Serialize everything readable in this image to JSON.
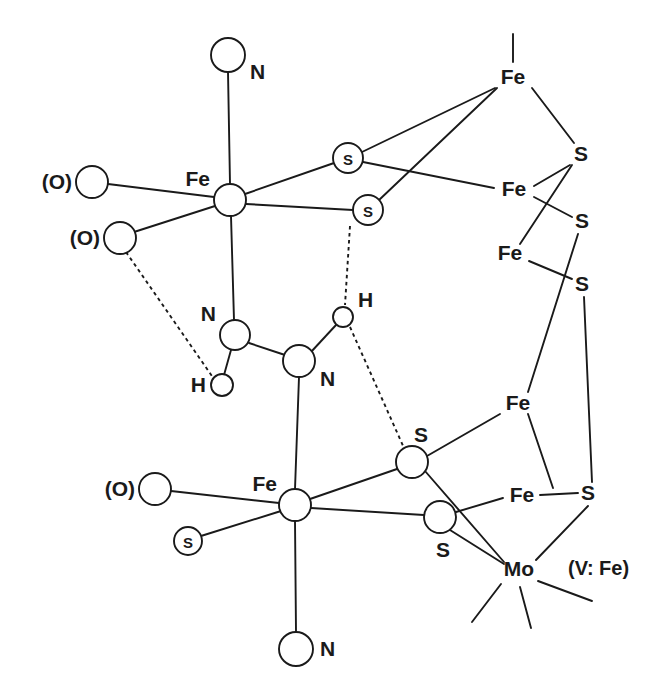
{
  "figure": {
    "kind": "chemical-structure-diagram",
    "title": "",
    "note": "(V: Fe)",
    "background_color": "#ffffff",
    "line_color": "#1a1a1a"
  },
  "labels": {
    "fe": "Fe",
    "s": "S",
    "n": "N",
    "h": "H",
    "mo": "Mo",
    "o_parenthetical": "(O)",
    "s_circled": "S",
    "alt_metal_note": "(V: Fe)"
  },
  "atoms": [
    {
      "id": "N-top",
      "label": "N",
      "label_pos": "right",
      "style": "open-circle",
      "x": 228,
      "y": 55,
      "r": 17
    },
    {
      "id": "Fe-upper",
      "label": "Fe",
      "label_pos": "upleft",
      "style": "open-circle",
      "x": 230,
      "y": 200,
      "r": 16
    },
    {
      "id": "O-upper",
      "label": "(O)",
      "label_pos": "left",
      "style": "open-circle",
      "x": 92,
      "y": 182,
      "r": 16
    },
    {
      "id": "O-lower",
      "label": "(O)",
      "label_pos": "left",
      "style": "open-circle",
      "x": 120,
      "y": 238,
      "r": 16
    },
    {
      "id": "S-bridge-1",
      "label": "S",
      "label_pos": "inside",
      "style": "circled-atom",
      "x": 348,
      "y": 158,
      "r": 15
    },
    {
      "id": "S-bridge-2",
      "label": "S",
      "label_pos": "inside",
      "style": "circled-atom",
      "x": 368,
      "y": 210,
      "r": 15
    },
    {
      "id": "Fe-top-right",
      "label": "Fe",
      "label_pos": "center",
      "style": "text-only",
      "x": 513,
      "y": 78,
      "r": 0
    },
    {
      "id": "S-tr-1",
      "label": "S",
      "label_pos": "center",
      "style": "text-only",
      "x": 581,
      "y": 155,
      "r": 0
    },
    {
      "id": "Fe-right-2",
      "label": "Fe",
      "label_pos": "center",
      "style": "text-only",
      "x": 514,
      "y": 190,
      "r": 0
    },
    {
      "id": "S-tr-2",
      "label": "S",
      "label_pos": "center",
      "style": "text-only",
      "x": 582,
      "y": 222,
      "r": 0
    },
    {
      "id": "Fe-right-3",
      "label": "Fe",
      "label_pos": "center",
      "style": "text-only",
      "x": 510,
      "y": 254,
      "r": 0
    },
    {
      "id": "S-tr-3",
      "label": "S",
      "label_pos": "center",
      "style": "text-only",
      "x": 582,
      "y": 285,
      "r": 0
    },
    {
      "id": "N-mid-left",
      "label": "N",
      "label_pos": "upleft",
      "style": "open-circle",
      "x": 235,
      "y": 335,
      "r": 15
    },
    {
      "id": "H-left",
      "label": "H",
      "label_pos": "left",
      "style": "open-circle",
      "x": 222,
      "y": 385,
      "r": 11
    },
    {
      "id": "N-mid-right",
      "label": "N",
      "label_pos": "right",
      "style": "open-circle",
      "x": 299,
      "y": 361,
      "r": 16
    },
    {
      "id": "H-right",
      "label": "H",
      "label_pos": "upright",
      "style": "open-circle",
      "x": 343,
      "y": 317,
      "r": 10
    },
    {
      "id": "S-mid",
      "label": "S",
      "label_pos": "upright",
      "style": "open-circle",
      "x": 412,
      "y": 462,
      "r": 16
    },
    {
      "id": "Fe-lower",
      "label": "Fe",
      "label_pos": "upleft",
      "style": "open-circle",
      "x": 295,
      "y": 505,
      "r": 16
    },
    {
      "id": "O-bottom",
      "label": "(O)",
      "label_pos": "left",
      "style": "open-circle",
      "x": 155,
      "y": 489,
      "r": 16
    },
    {
      "id": "S-circled-lo",
      "label": "S",
      "label_pos": "inside",
      "style": "circled-atom",
      "x": 188,
      "y": 541,
      "r": 14
    },
    {
      "id": "S-lower-br",
      "label": "S",
      "label_pos": "down",
      "style": "open-circle",
      "x": 440,
      "y": 517,
      "r": 16
    },
    {
      "id": "N-bottom",
      "label": "N",
      "label_pos": "right",
      "style": "open-circle",
      "x": 296,
      "y": 649,
      "r": 17
    },
    {
      "id": "Fe-low-right",
      "label": "Fe",
      "label_pos": "center",
      "style": "text-only",
      "x": 518,
      "y": 404,
      "r": 0
    },
    {
      "id": "Fe-low-r2",
      "label": "Fe",
      "label_pos": "center",
      "style": "text-only",
      "x": 522,
      "y": 496,
      "r": 0
    },
    {
      "id": "S-low-right",
      "label": "S",
      "label_pos": "center",
      "style": "text-only",
      "x": 588,
      "y": 494,
      "r": 0
    },
    {
      "id": "Mo",
      "label": "Mo",
      "label_pos": "center",
      "style": "text-only",
      "x": 519,
      "y": 570,
      "r": 0
    }
  ],
  "bonds": [
    {
      "from": "N-top",
      "to": "Fe-upper",
      "type": "solid"
    },
    {
      "from": "Fe-upper",
      "to": "O-upper",
      "type": "solid"
    },
    {
      "from": "Fe-upper",
      "to": "O-lower",
      "type": "solid"
    },
    {
      "from": "Fe-upper",
      "to": "N-mid-left",
      "type": "solid"
    },
    {
      "from": "Fe-upper",
      "to": "S-bridge-1",
      "type": "solid"
    },
    {
      "from": "Fe-upper",
      "to": "S-bridge-2",
      "type": "solid"
    },
    {
      "from": "S-bridge-1",
      "to": "Fe-top-right",
      "type": "solid"
    },
    {
      "from": "S-bridge-2",
      "to": "Fe-top-right",
      "type": "solid"
    },
    {
      "from": "S-bridge-1",
      "to": "Fe-right-2",
      "type": "solid"
    },
    {
      "from": "Fe-top-right",
      "to": "S-tr-1",
      "type": "solid"
    },
    {
      "from": "S-tr-1",
      "to": "Fe-right-2",
      "type": "solid"
    },
    {
      "from": "S-tr-1",
      "to": "Fe-right-3",
      "type": "solid"
    },
    {
      "from": "Fe-right-2",
      "to": "S-tr-2",
      "type": "solid"
    },
    {
      "from": "Fe-right-3",
      "to": "S-tr-3",
      "type": "solid"
    },
    {
      "from": "S-tr-2",
      "to": "Fe-low-right",
      "type": "solid"
    },
    {
      "from": "S-tr-3",
      "to": "S-low-right",
      "type": "solid"
    },
    {
      "from": "N-mid-left",
      "to": "H-left",
      "type": "solid"
    },
    {
      "from": "N-mid-left",
      "to": "N-mid-right",
      "type": "solid"
    },
    {
      "from": "N-mid-right",
      "to": "H-right",
      "type": "solid"
    },
    {
      "from": "N-mid-right",
      "to": "Fe-lower",
      "type": "solid"
    },
    {
      "from": "O-lower",
      "to": "H-left",
      "type": "hydrogen-bond"
    },
    {
      "from": "S-bridge-2",
      "to": "H-right",
      "type": "hydrogen-bond"
    },
    {
      "from": "H-right",
      "to": "S-mid",
      "type": "hydrogen-bond"
    },
    {
      "from": "Fe-lower",
      "to": "O-bottom",
      "type": "solid"
    },
    {
      "from": "Fe-lower",
      "to": "S-circled-lo",
      "type": "solid"
    },
    {
      "from": "Fe-lower",
      "to": "N-bottom",
      "type": "solid"
    },
    {
      "from": "Fe-lower",
      "to": "S-mid",
      "type": "solid"
    },
    {
      "from": "Fe-lower",
      "to": "S-lower-br",
      "type": "solid"
    },
    {
      "from": "S-mid",
      "to": "Fe-low-right",
      "type": "solid"
    },
    {
      "from": "S-mid",
      "to": "Mo",
      "type": "solid"
    },
    {
      "from": "S-lower-br",
      "to": "Fe-low-r2",
      "type": "solid"
    },
    {
      "from": "S-lower-br",
      "to": "Mo",
      "type": "solid"
    },
    {
      "from": "Fe-low-right",
      "to": "Fe-low-r2",
      "type": "solid"
    },
    {
      "from": "Fe-low-r2",
      "to": "S-low-right",
      "type": "solid"
    },
    {
      "from": "S-low-right",
      "to": "Mo",
      "type": "solid"
    }
  ],
  "stubs": [
    {
      "at": "Fe-top-right",
      "x1": 513,
      "y1": 34,
      "x2": 513,
      "y2": 62,
      "name": "fe-top-axial-stub"
    },
    {
      "at": "Mo",
      "x1": 500,
      "y1": 585,
      "x2": 472,
      "y2": 622,
      "name": "mo-stub-left"
    },
    {
      "at": "Mo",
      "x1": 519,
      "y1": 588,
      "x2": 530,
      "y2": 628,
      "name": "mo-stub-down"
    },
    {
      "at": "Mo",
      "x1": 538,
      "y1": 582,
      "x2": 592,
      "y2": 601,
      "name": "mo-stub-right"
    }
  ]
}
